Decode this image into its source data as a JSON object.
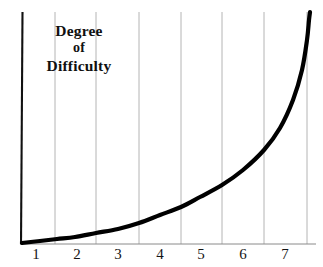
{
  "chart_data": {
    "type": "line",
    "title": "Degree of Difficulty",
    "title_lines": [
      "Degree",
      "of",
      "Difficulty"
    ],
    "xlabel": "",
    "ylabel": "Degree of Difficulty",
    "x_tick_labels": [
      "1",
      "2",
      "3",
      "4",
      "5",
      "6",
      "7"
    ],
    "y_tick_labels": [],
    "xlim": [
      0,
      7.6
    ],
    "ylim": [
      0,
      1
    ],
    "grid": "vertical only",
    "legend": "none",
    "annotations": [],
    "series": [
      {
        "name": "Degree of Difficulty",
        "color": "#000000",
        "line_width": 4,
        "x": [
          0.05,
          0.5,
          1,
          1.5,
          2,
          2.5,
          3,
          3.5,
          4,
          4.5,
          5,
          5.5,
          6,
          6.5,
          7,
          7.3,
          7.45
        ],
        "values": [
          0.005,
          0.012,
          0.025,
          0.04,
          0.06,
          0.085,
          0.115,
          0.15,
          0.195,
          0.25,
          0.32,
          0.4,
          0.5,
          0.62,
          0.78,
          0.9,
          1.0
        ]
      }
    ],
    "curve_points_px": [
      [
        22,
        243
      ],
      [
        40,
        241
      ],
      [
        57,
        239
      ],
      [
        75,
        237
      ],
      [
        96,
        233
      ],
      [
        118,
        229
      ],
      [
        139,
        223
      ],
      [
        160,
        215
      ],
      [
        181,
        207
      ],
      [
        200,
        197
      ],
      [
        222,
        185
      ],
      [
        243,
        170
      ],
      [
        264,
        150
      ],
      [
        280,
        128
      ],
      [
        293,
        100
      ],
      [
        302,
        70
      ],
      [
        307,
        40
      ],
      [
        309,
        20
      ],
      [
        310,
        12
      ]
    ]
  },
  "axes": {
    "y_axis_color": "#111111",
    "x_axis_color": "#8a8a8a",
    "gridline_color": "#b4b4b4",
    "y_axis_x_px": 21,
    "x_axis_y_px": 244,
    "gridlines_x_px": [
      55,
      96,
      139,
      181,
      222,
      264,
      307
    ],
    "x_label_positions_px": [
      36,
      77,
      118,
      160,
      201,
      243,
      285
    ]
  },
  "colors": {
    "background": "#ffffff",
    "curve": "#000000",
    "text": "#111111"
  }
}
